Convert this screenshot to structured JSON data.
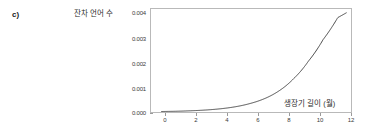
{
  "figure": {
    "panel_label": "c)",
    "y_axis_title": "잔차 언어 수",
    "x_axis_title": "생장기 길이 (월)",
    "curve_color": "#4a4a4a",
    "axis_color": "#b9b9b9",
    "background": "#ffffff"
  },
  "chart_data": {
    "type": "line",
    "title": "",
    "subtitle": "",
    "xlabel": "생장기 길이 (월)",
    "ylabel": "잔차 언어 수",
    "xlim": [
      -0.7,
      12.9
    ],
    "ylim": [
      0.0,
      0.0042
    ],
    "grid": false,
    "legend": null,
    "xticks": [
      0,
      2,
      4,
      6,
      8,
      10,
      12
    ],
    "xtick_labels": [
      "0",
      "2",
      "4",
      "6",
      "8",
      "10",
      "12"
    ],
    "yticks": [
      0.0,
      0.001,
      0.002,
      0.003,
      0.004
    ],
    "ytick_labels": [
      "0.000",
      "0.001",
      "0.002",
      "0.003",
      "0.004"
    ],
    "series": [
      {
        "name": "잔차 언어 수",
        "x": [
          0,
          1,
          2,
          3,
          4,
          5,
          6,
          7,
          8,
          9,
          10,
          11,
          12,
          12.6
        ],
        "y": [
          2e-05,
          3e-05,
          5e-05,
          8e-05,
          0.00013,
          0.00021,
          0.00034,
          0.00054,
          0.00086,
          0.00136,
          0.00207,
          0.00295,
          0.00385,
          0.00405
        ]
      }
    ],
    "annotations": [
      {
        "text": "c)",
        "role": "panel-label"
      }
    ]
  }
}
